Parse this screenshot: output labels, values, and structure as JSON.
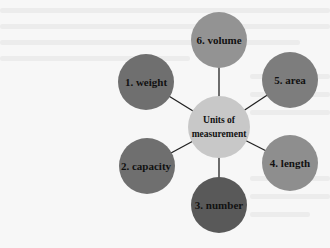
{
  "diagram": {
    "center": {
      "line1": "Units of",
      "line2": "measurement",
      "color": "#c8c8c8"
    },
    "nodes": [
      {
        "label": "1. weight",
        "color": "#6f6f6f"
      },
      {
        "label": "2. capacity",
        "color": "#6f6f6f"
      },
      {
        "label": "3. number",
        "color": "#595959"
      },
      {
        "label": "4. length",
        "color": "#8e8e8e"
      },
      {
        "label": "5. area",
        "color": "#7d7d7d"
      },
      {
        "label": "6. volume",
        "color": "#939393"
      }
    ],
    "connector_color": "#222222"
  }
}
